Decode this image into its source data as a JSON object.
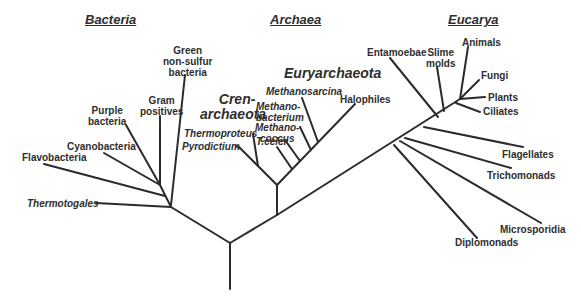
{
  "diagram": {
    "type": "phylogenetic-tree"
  },
  "domains": {
    "bacteria": "Bacteria",
    "archaea": "Archaea",
    "eucarya": "Eucarya"
  },
  "groups": {
    "crenarchaeota_line1": "Cren-",
    "crenarchaeota_line2": "archaeota",
    "euryarchaeota": "Euryarchaeota"
  },
  "bacteria": {
    "green_line1": "Green",
    "green_line2": "non-sulfur",
    "green_line3": "bacteria",
    "gram_line1": "Gram",
    "gram_line2": "positives",
    "purple_line1": "Purple",
    "purple_line2": "bacteria",
    "cyanobacteria": "Cyanobacteria",
    "flavobacteria": "Flavobacteria",
    "thermotogales": "Thermotogales"
  },
  "archaea": {
    "methanosarcina": "Methanosarcina",
    "methanobacterium_line1": "Methano-",
    "methanobacterium_line2": "bacterium",
    "halophiles": "Halophiles",
    "methanococcus_line1": "Methano-",
    "methanococcus_line2": "coccus",
    "t_celer": "T.celer",
    "thermoproteus": "Thermoproteus",
    "pyrodictium": "Pyrodictium"
  },
  "eucarya": {
    "entamoebae": "Entamoebae",
    "slime_line1": "Slime",
    "slime_line2": "molds",
    "animals": "Animals",
    "fungi": "Fungi",
    "plants": "Plants",
    "ciliates": "Ciliates",
    "flagellates": "Flagellates",
    "trichomonads": "Trichomonads",
    "microsporidia": "Microsporidia",
    "diplomonads": "Diplomonads"
  }
}
